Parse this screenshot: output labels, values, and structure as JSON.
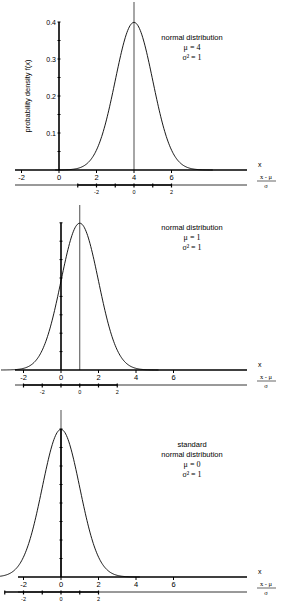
{
  "chart_data": [
    {
      "type": "line",
      "title": "normal distribution",
      "annotation": [
        "normal distribution",
        "μ = 4",
        "σ² = 1"
      ],
      "mu": 4,
      "sigma2": 1,
      "ylabel": "probability density f(x)",
      "xlabel": "x",
      "secondary_xlabel": "(x - μ) / σ",
      "x_ticks": [
        -2,
        0,
        2,
        4,
        6
      ],
      "z_ticks": [
        -2,
        0,
        2
      ],
      "y_ticks": [
        0.1,
        0.2,
        0.3,
        0.4
      ],
      "ylim": [
        0,
        0.4
      ],
      "xlim": [
        -2.3,
        10
      ],
      "layout": {
        "axis_y": 170,
        "x0": 59,
        "px_per_x": 18.75,
        "px_per_density": 370,
        "z_axis_y": 185,
        "axis_x_start": 15,
        "axis_x_end": 247,
        "vline_top": 2,
        "show_y_labels": true
      }
    },
    {
      "type": "line",
      "title": "normal distribution",
      "annotation": [
        "normal distribution",
        "μ = 1",
        "σ² = 1"
      ],
      "mu": 1,
      "sigma2": 1,
      "xlabel": "x",
      "secondary_xlabel": "(x - μ) / σ",
      "x_ticks": [
        -2,
        0,
        2,
        4,
        6
      ],
      "z_ticks": [
        -2,
        0,
        2
      ],
      "ylim": [
        0,
        0.4
      ],
      "layout": {
        "axis_y": 370,
        "x0": 61,
        "px_per_x": 18.75,
        "px_per_density": 368,
        "z_axis_y": 385,
        "axis_x_start": 15,
        "axis_x_end": 247,
        "vline_top": 205,
        "show_y_labels": false
      }
    },
    {
      "type": "line",
      "title": "standard normal distribution",
      "annotation": [
        "standard",
        "normal distribution",
        "μ = 0",
        "σ² = 1"
      ],
      "mu": 0,
      "sigma2": 1,
      "xlabel": "x",
      "secondary_xlabel": "(x - μ) / σ",
      "x_ticks": [
        -2,
        0,
        2,
        4,
        6
      ],
      "z_ticks": [
        -2,
        0,
        2
      ],
      "ylim": [
        0,
        0.4
      ],
      "layout": {
        "axis_y": 577,
        "x0": 61,
        "px_per_x": 18.75,
        "px_per_density": 370,
        "z_axis_y": 592,
        "axis_x_start": 18,
        "axis_x_end": 247,
        "vline_top": 410,
        "show_y_labels": false
      }
    }
  ],
  "labels": {
    "x": "x",
    "z_num": "x - μ",
    "z_den": "σ",
    "ylabel": "probability density f(x)"
  }
}
